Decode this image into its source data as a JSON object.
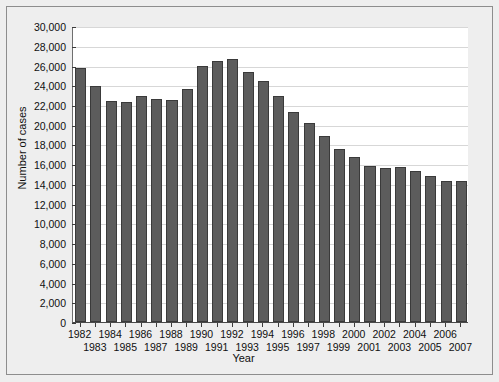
{
  "chart_data": {
    "type": "bar",
    "title": "",
    "xlabel": "Year",
    "ylabel": "Number of cases",
    "categories": [
      "1982",
      "1983",
      "1984",
      "1985",
      "1986",
      "1987",
      "1988",
      "1989",
      "1990",
      "1991",
      "1992",
      "1993",
      "1994",
      "1995",
      "1996",
      "1997",
      "1998",
      "1999",
      "2000",
      "2001",
      "2002",
      "2003",
      "2004",
      "2005",
      "2006",
      "2007"
    ],
    "values": [
      25700,
      23900,
      22400,
      22300,
      22900,
      22600,
      22550,
      23600,
      25900,
      26450,
      26700,
      25300,
      24400,
      22900,
      21300,
      20200,
      18900,
      17500,
      16700,
      15800,
      15600,
      15700,
      15300,
      14800,
      14300,
      14250
    ],
    "ylim": [
      0,
      30000
    ],
    "ytick_step": 2000,
    "ytick_labels": [
      "30,000",
      "28,000",
      "26,000",
      "24,000",
      "22,000",
      "20,000",
      "18,000",
      "16,000",
      "14,000",
      "12,000",
      "10,000",
      "8,000",
      "6,000",
      "4,000",
      "2,000",
      "0"
    ],
    "ytick_values": [
      30000,
      28000,
      26000,
      24000,
      22000,
      20000,
      18000,
      16000,
      14000,
      12000,
      10000,
      8000,
      6000,
      4000,
      2000,
      0
    ],
    "grid": true,
    "legend": null,
    "bar_color": "#5c5c5c",
    "bar_edge_color": "#3a3a3a",
    "plot_background": "#ffffff",
    "figure_background": "#eeeeee",
    "gridline_color": "#d7d7d7",
    "axis_color": "#4a4a4a",
    "xtick_row_top": [
      "1982",
      "1984",
      "1986",
      "1988",
      "1990",
      "1992",
      "1994",
      "1996",
      "1998",
      "2000",
      "2002",
      "2004",
      "2006"
    ],
    "xtick_row_bottom": [
      "1983",
      "1985",
      "1987",
      "1989",
      "1991",
      "1993",
      "1995",
      "1997",
      "1999",
      "2001",
      "2003",
      "2005",
      "2007"
    ]
  }
}
